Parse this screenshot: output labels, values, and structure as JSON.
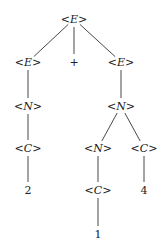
{
  "nodes": [
    {
      "id": "n0",
      "label": "<E>",
      "kind": "nonterminal"
    },
    {
      "id": "n1",
      "label": "<E>",
      "kind": "nonterminal"
    },
    {
      "id": "n2",
      "label": "+",
      "kind": "terminal"
    },
    {
      "id": "n3",
      "label": "<E>",
      "kind": "nonterminal"
    },
    {
      "id": "n4",
      "label": "<N>",
      "kind": "nonterminal"
    },
    {
      "id": "n5",
      "label": "<N>",
      "kind": "nonterminal"
    },
    {
      "id": "n6",
      "label": "<C>",
      "kind": "nonterminal"
    },
    {
      "id": "n7",
      "label": "<N>",
      "kind": "nonterminal"
    },
    {
      "id": "n8",
      "label": "<C>",
      "kind": "nonterminal"
    },
    {
      "id": "n9",
      "label": "2",
      "kind": "terminal"
    },
    {
      "id": "n10",
      "label": "<C>",
      "kind": "nonterminal"
    },
    {
      "id": "n11",
      "label": "4",
      "kind": "terminal"
    },
    {
      "id": "n12",
      "label": "1",
      "kind": "terminal"
    }
  ],
  "edges": [
    [
      "n0",
      "n1"
    ],
    [
      "n0",
      "n2"
    ],
    [
      "n0",
      "n3"
    ],
    [
      "n1",
      "n4"
    ],
    [
      "n3",
      "n5"
    ],
    [
      "n4",
      "n6"
    ],
    [
      "n5",
      "n7"
    ],
    [
      "n5",
      "n8"
    ],
    [
      "n6",
      "n9"
    ],
    [
      "n7",
      "n10"
    ],
    [
      "n8",
      "n11"
    ],
    [
      "n10",
      "n12"
    ]
  ]
}
